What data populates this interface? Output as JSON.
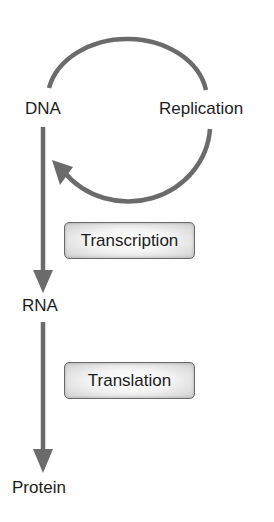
{
  "diagram": {
    "nodes": {
      "dna": {
        "label": "DNA"
      },
      "rna": {
        "label": "RNA"
      },
      "protein": {
        "label": "Protein"
      },
      "replication": {
        "label": "Replication"
      }
    },
    "processes": {
      "transcription": {
        "label": "Transcription"
      },
      "translation": {
        "label": "Translation"
      }
    },
    "edges": [
      {
        "from": "DNA",
        "to": "DNA",
        "label": "Replication",
        "type": "circular-arrow"
      },
      {
        "from": "DNA",
        "to": "RNA",
        "label": "Transcription",
        "type": "down-arrow"
      },
      {
        "from": "RNA",
        "to": "Protein",
        "label": "Translation",
        "type": "down-arrow"
      }
    ],
    "colors": {
      "arrow": "#6b6b6b",
      "text": "#1c1c1c",
      "box_border": "#6a6a6a",
      "box_fill": "#e8e8e8",
      "background": "#ffffff"
    }
  }
}
